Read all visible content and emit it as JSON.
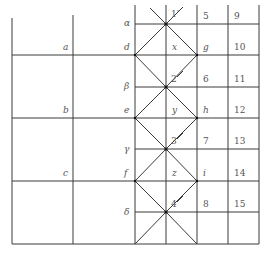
{
  "diagram": {
    "left_labels": [
      "a",
      "b",
      "c"
    ],
    "greek_labels": [
      "α",
      "β",
      "γ",
      "δ"
    ],
    "side_left_labels": [
      "d",
      "e",
      "f"
    ],
    "center_labels": [
      "x",
      "y",
      "z"
    ],
    "side_right_labels": [
      "g",
      "h",
      "i"
    ],
    "node_labels": [
      "1′",
      "2",
      "3",
      "4"
    ],
    "col5_labels": [
      "5",
      "6",
      "7",
      "8"
    ],
    "col6_labels": [
      "9",
      "10",
      "11",
      "12",
      "13",
      "14",
      "15"
    ],
    "colors": {
      "line": "#3a3a3a",
      "text": "#555555",
      "node": "#111111"
    }
  }
}
